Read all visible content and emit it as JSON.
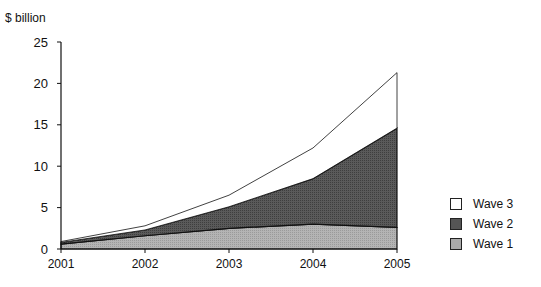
{
  "chart_data": {
    "type": "area",
    "stacked": true,
    "title": "",
    "xlabel": "",
    "ylabel": "$ billion",
    "categories": [
      "2001",
      "2002",
      "2003",
      "2004",
      "2005"
    ],
    "series": [
      {
        "name": "Wave 1",
        "values": [
          0.6,
          1.6,
          2.5,
          3.0,
          2.6
        ],
        "color": "#aaaaaa"
      },
      {
        "name": "Wave 2",
        "values": [
          0.2,
          0.7,
          2.6,
          5.5,
          12.0
        ],
        "color": "#555555"
      },
      {
        "name": "Wave 3",
        "values": [
          0.1,
          0.5,
          1.4,
          3.7,
          6.7
        ],
        "color": "#ffffff"
      }
    ],
    "ylim": [
      0,
      25
    ],
    "yticks": [
      0,
      5,
      10,
      15,
      20,
      25
    ],
    "grid": false,
    "legend_position": "right",
    "legend_order": [
      "Wave 3",
      "Wave 2",
      "Wave 1"
    ]
  },
  "axis": {
    "y_title": "$ billion"
  },
  "legend": {
    "items": [
      {
        "label": "Wave 3",
        "color": "#ffffff"
      },
      {
        "label": "Wave 2",
        "color": "#555555"
      },
      {
        "label": "Wave 1",
        "color": "#aaaaaa"
      }
    ]
  }
}
